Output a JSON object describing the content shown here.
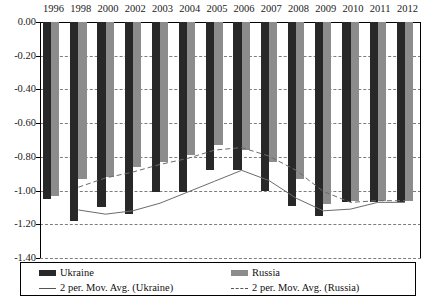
{
  "chart_data": {
    "type": "bar",
    "title": "",
    "subtitle": "",
    "xlabel": "",
    "ylabel": "",
    "ylim": [
      -1.4,
      0.0
    ],
    "ytick_step": 0.2,
    "grid": true,
    "legend_position": "bottom",
    "categories": [
      "1996",
      "1998",
      "2000",
      "2002",
      "2003",
      "2004",
      "2005",
      "2006",
      "2007",
      "2008",
      "2009",
      "2010",
      "2011",
      "2012"
    ],
    "ytick_labels": [
      "0.00",
      "-0.20",
      "-0.40",
      "-0.60",
      "-0.80",
      "-1.00",
      "-1.20",
      "-1.40"
    ],
    "ytick_values": [
      0.0,
      -0.2,
      -0.4,
      -0.6,
      -0.8,
      -1.0,
      -1.2,
      -1.4
    ],
    "series": [
      {
        "name": "Ukraine",
        "color": "#282828",
        "values": [
          -1.05,
          -1.18,
          -1.1,
          -1.14,
          -1.01,
          -1.01,
          -0.88,
          -0.88,
          -1.0,
          -1.09,
          -1.15,
          -1.07,
          -1.07,
          -1.07
        ]
      },
      {
        "name": "Russia",
        "color": "#8c8c8c",
        "values": [
          -1.03,
          -0.93,
          -0.92,
          -0.86,
          -0.83,
          -0.79,
          -0.73,
          -0.76,
          -0.83,
          -0.93,
          -1.08,
          -1.06,
          -1.06,
          -1.06
        ]
      }
    ],
    "trendlines": [
      {
        "name": "2 per. Mov. Avg. (Ukraine)",
        "style": "solid",
        "color": "#6b6b6b",
        "values": [
          null,
          -1.115,
          -1.14,
          -1.12,
          -1.075,
          -1.01,
          -0.945,
          -0.88,
          -0.94,
          -1.045,
          -1.12,
          -1.11,
          -1.07,
          -1.07
        ]
      },
      {
        "name": "2 per. Mov. Avg. (Russia)",
        "style": "dashed",
        "color": "#6b6b6b",
        "values": [
          null,
          -0.98,
          -0.925,
          -0.89,
          -0.845,
          -0.81,
          -0.76,
          -0.745,
          -0.795,
          -0.88,
          -1.005,
          -1.07,
          -1.06,
          -1.06
        ]
      }
    ]
  },
  "legend": {
    "entries": [
      {
        "label": "Ukraine",
        "marker": "bar-swatch-dark"
      },
      {
        "label": "Russia",
        "marker": "bar-swatch-gray"
      },
      {
        "label": "2 per. Mov. Avg. (Ukraine)",
        "marker": "solid-line"
      },
      {
        "label": "2 per. Mov. Avg. (Russia)",
        "marker": "dashed-line"
      }
    ]
  }
}
